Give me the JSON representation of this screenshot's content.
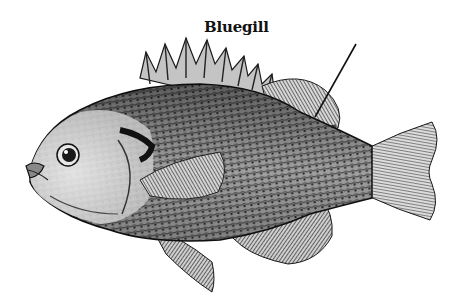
{
  "illustration": {
    "subject": "Bluegill fish engraving",
    "style": "black-and-white stippled engraving",
    "label": "Bluegill",
    "pointer_target": "soft dorsal fin",
    "colors": {
      "background": "#ffffff",
      "ink": "#111111",
      "mid": "#6b6b6b",
      "light": "#bdbdbd"
    }
  }
}
